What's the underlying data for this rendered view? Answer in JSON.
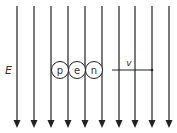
{
  "field": {
    "label": "E",
    "line_x": [
      17,
      34,
      51,
      68,
      85,
      102,
      119,
      135,
      152,
      169
    ],
    "direction": "down",
    "color": "#222222"
  },
  "particles": [
    {
      "label": "p",
      "cx": 60
    },
    {
      "label": "e",
      "cx": 77
    },
    {
      "label": "n",
      "cx": 94
    }
  ],
  "velocity": {
    "label": "v"
  }
}
